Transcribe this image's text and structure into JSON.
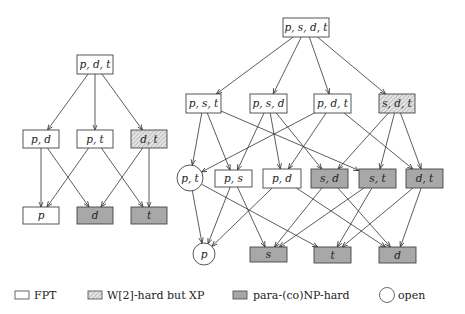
{
  "colors": {
    "fpt": "#ffffff",
    "w2": "#d8d8d8",
    "paranp": "#a8a8a8",
    "stroke": "#444444"
  },
  "legend": {
    "fpt": "FPT",
    "w2": "W[2]-hard but XP",
    "paranp": "para-(co)NP-hard",
    "open": "open"
  },
  "left_graph": {
    "nodes": [
      {
        "id": "pdt",
        "label": "p, d, t",
        "class": "fpt",
        "shape": "rect",
        "x": 77,
        "y": 55,
        "w": 36,
        "h": 19
      },
      {
        "id": "pd",
        "label": "p, d",
        "class": "fpt",
        "shape": "rect",
        "x": 23,
        "y": 130,
        "w": 36,
        "h": 18
      },
      {
        "id": "pt",
        "label": "p, t",
        "class": "fpt",
        "shape": "rect",
        "x": 77,
        "y": 130,
        "w": 36,
        "h": 18
      },
      {
        "id": "dt",
        "label": "d, t",
        "class": "w2",
        "shape": "rect",
        "x": 131,
        "y": 130,
        "w": 36,
        "h": 18
      },
      {
        "id": "p",
        "label": "p",
        "class": "fpt",
        "shape": "rect",
        "x": 23,
        "y": 207,
        "w": 36,
        "h": 17
      },
      {
        "id": "d",
        "label": "d",
        "class": "paranp",
        "shape": "rect",
        "x": 77,
        "y": 207,
        "w": 36,
        "h": 17
      },
      {
        "id": "t",
        "label": "t",
        "class": "paranp",
        "shape": "rect",
        "x": 131,
        "y": 207,
        "w": 36,
        "h": 17
      }
    ],
    "edges": [
      [
        "pdt",
        "pd"
      ],
      [
        "pdt",
        "pt"
      ],
      [
        "pdt",
        "dt"
      ],
      [
        "pd",
        "p"
      ],
      [
        "pd",
        "d"
      ],
      [
        "pt",
        "p"
      ],
      [
        "pt",
        "t"
      ],
      [
        "dt",
        "d"
      ],
      [
        "dt",
        "t"
      ]
    ]
  },
  "right_graph": {
    "nodes": [
      {
        "id": "psdt",
        "label": "p, s, d, t",
        "class": "fpt",
        "shape": "rect",
        "x": 283,
        "y": 18,
        "w": 46,
        "h": 19
      },
      {
        "id": "pst",
        "label": "p, s, t",
        "class": "fpt",
        "shape": "rect",
        "x": 186,
        "y": 94,
        "w": 35,
        "h": 19
      },
      {
        "id": "psd",
        "label": "p, s, d",
        "class": "fpt",
        "shape": "rect",
        "x": 250,
        "y": 94,
        "w": 37,
        "h": 19
      },
      {
        "id": "pdt",
        "label": "p, d, t",
        "class": "fpt",
        "shape": "rect",
        "x": 314,
        "y": 94,
        "w": 37,
        "h": 19
      },
      {
        "id": "sdt",
        "label": "s, d, t",
        "class": "w2",
        "shape": "rect",
        "x": 379,
        "y": 94,
        "w": 36,
        "h": 19
      },
      {
        "id": "pt",
        "label": "p, t",
        "class": "open",
        "shape": "circle",
        "cx": 190,
        "cy": 178,
        "r": 13
      },
      {
        "id": "ps",
        "label": "p, s",
        "class": "fpt",
        "shape": "rect",
        "x": 215,
        "y": 170,
        "w": 37,
        "h": 17
      },
      {
        "id": "pd",
        "label": "p, d",
        "class": "fpt",
        "shape": "rect",
        "x": 263,
        "y": 169,
        "w": 38,
        "h": 19
      },
      {
        "id": "sd",
        "label": "s, d",
        "class": "paranp",
        "shape": "rect",
        "x": 311,
        "y": 169,
        "w": 37,
        "h": 19
      },
      {
        "id": "st",
        "label": "s, t",
        "class": "paranp",
        "shape": "rect",
        "x": 359,
        "y": 169,
        "w": 37,
        "h": 19
      },
      {
        "id": "dt",
        "label": "d, t",
        "class": "paranp",
        "shape": "rect",
        "x": 406,
        "y": 169,
        "w": 37,
        "h": 19
      },
      {
        "id": "p",
        "label": "p",
        "class": "open",
        "shape": "circle",
        "cx": 204,
        "cy": 254,
        "r": 11
      },
      {
        "id": "s",
        "label": "s",
        "class": "paranp",
        "shape": "rect",
        "x": 250,
        "y": 247,
        "w": 37,
        "h": 15
      },
      {
        "id": "t",
        "label": "t",
        "class": "paranp",
        "shape": "rect",
        "x": 314,
        "y": 247,
        "w": 37,
        "h": 16
      },
      {
        "id": "d",
        "label": "d",
        "class": "paranp",
        "shape": "rect",
        "x": 379,
        "y": 247,
        "w": 37,
        "h": 16
      }
    ],
    "edges": [
      [
        "psdt",
        "pst"
      ],
      [
        "psdt",
        "psd"
      ],
      [
        "psdt",
        "pdt"
      ],
      [
        "psdt",
        "sdt"
      ],
      [
        "pst",
        "pt"
      ],
      [
        "pst",
        "ps"
      ],
      [
        "pst",
        "st"
      ],
      [
        "psd",
        "ps"
      ],
      [
        "psd",
        "pd"
      ],
      [
        "psd",
        "sd"
      ],
      [
        "pdt",
        "pt"
      ],
      [
        "pdt",
        "pd"
      ],
      [
        "pdt",
        "dt"
      ],
      [
        "sdt",
        "sd"
      ],
      [
        "sdt",
        "st"
      ],
      [
        "sdt",
        "dt"
      ],
      [
        "pt",
        "p"
      ],
      [
        "pt",
        "t"
      ],
      [
        "ps",
        "p"
      ],
      [
        "ps",
        "s"
      ],
      [
        "pd",
        "p"
      ],
      [
        "pd",
        "d"
      ],
      [
        "sd",
        "s"
      ],
      [
        "sd",
        "d"
      ],
      [
        "st",
        "s"
      ],
      [
        "st",
        "t"
      ],
      [
        "dt",
        "t"
      ],
      [
        "dt",
        "d"
      ]
    ]
  }
}
